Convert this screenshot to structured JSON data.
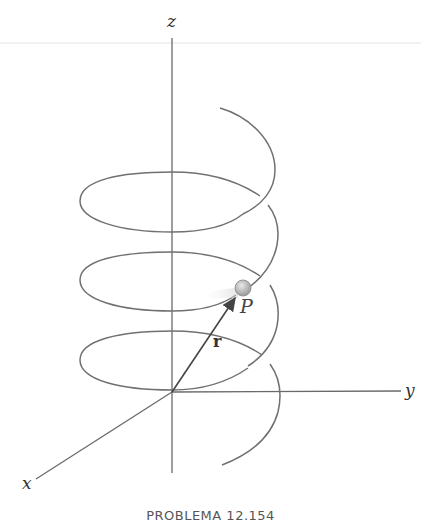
{
  "figure": {
    "caption": "PROBLEMA 12.154",
    "axes": {
      "x_label": "x",
      "y_label": "y",
      "z_label": "z"
    },
    "point": {
      "label": "P"
    },
    "vector": {
      "label": "r"
    },
    "curve": "helix",
    "colors": {
      "line": "#707070",
      "axis": "#6a6a6a",
      "text": "#333333",
      "point_fill": "#b9b9b9",
      "separator": "#ececec"
    }
  }
}
